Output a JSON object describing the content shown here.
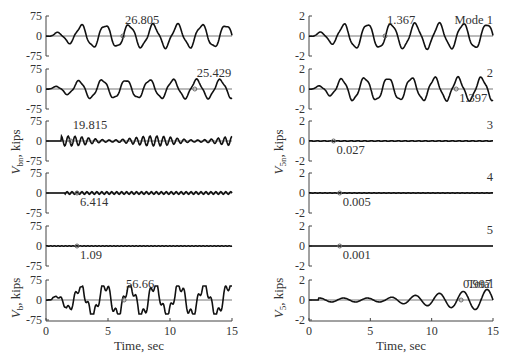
{
  "chart_data": [
    {
      "type": "line",
      "column": "left",
      "ylabel": "V_bn, kips",
      "xlabel": "Time, sec",
      "xlim": [
        0,
        15
      ],
      "xticks": [
        0,
        5,
        10,
        15
      ],
      "panels": [
        {
          "mode": 1,
          "ylim": [
            -75,
            75
          ],
          "yticks": [
            "75",
            "0",
            "-75"
          ],
          "peak_label": "26.805",
          "peak_time": 6.2
        },
        {
          "mode": 2,
          "ylim": [
            -75,
            75
          ],
          "yticks": [
            "75",
            "0",
            "-75"
          ],
          "peak_label": "25.429",
          "peak_time": 12.0
        },
        {
          "mode": 3,
          "ylim": [
            -75,
            75
          ],
          "yticks": [
            "75",
            "0",
            "-75"
          ],
          "peak_label": "19.815",
          "peak_time": 2.0
        },
        {
          "mode": 4,
          "ylim": [
            -75,
            75
          ],
          "yticks": [
            "75",
            "0",
            "-75"
          ],
          "peak_label": "6.414",
          "peak_time": 2.5
        },
        {
          "mode": 5,
          "ylim": [
            -75,
            75
          ],
          "yticks": [
            "75",
            "0",
            "-75"
          ],
          "peak_label": "1.09",
          "peak_time": 2.5
        },
        {
          "mode": "Total",
          "ylabel": "V_b, kips",
          "ylim": [
            -75,
            75
          ],
          "yticks": [
            "75",
            "0",
            "-75"
          ],
          "peak_label": "56.66",
          "peak_time": 6.3
        }
      ]
    },
    {
      "type": "line",
      "column": "right",
      "ylabel": "V_5n, kips",
      "xlabel": "Time, sec",
      "xlim": [
        0,
        15
      ],
      "xticks": [
        0,
        5,
        10,
        15
      ],
      "panels": [
        {
          "mode": 1,
          "tag": "Mode 1",
          "ylim": [
            -2,
            2
          ],
          "yticks": [
            "2",
            "0",
            "-2"
          ],
          "peak_label": "1.367",
          "peak_time": 6.2
        },
        {
          "mode": 2,
          "tag": "2",
          "ylim": [
            -2,
            2
          ],
          "yticks": [
            "2",
            "0",
            "-2"
          ],
          "peak_label": "1.397",
          "peak_time": 12.0
        },
        {
          "mode": 3,
          "tag": "3",
          "ylim": [
            -2,
            2
          ],
          "yticks": [
            "2",
            "0",
            "-2"
          ],
          "peak_label": "0.027",
          "peak_time": 2.0
        },
        {
          "mode": 4,
          "tag": "4",
          "ylim": [
            -2,
            2
          ],
          "yticks": [
            "2",
            "0",
            "-2"
          ],
          "peak_label": "0.005",
          "peak_time": 2.5
        },
        {
          "mode": 5,
          "tag": "5",
          "ylim": [
            -2,
            2
          ],
          "yticks": [
            "2",
            "0",
            "-2"
          ],
          "peak_label": "0.001",
          "peak_time": 2.5
        },
        {
          "mode": "Total",
          "tag": "Total",
          "ylabel": "V_5, kips",
          "ylim": [
            -2,
            2
          ],
          "yticks": [
            "2",
            "0",
            "-2"
          ],
          "peak_label": "0.997",
          "peak_time": 12.4
        }
      ]
    }
  ],
  "labels": {
    "left_ylabel_main": "V",
    "left_ylabel_sub": "bn",
    "left_ylabel_unit": ", kips",
    "left_total_ylabel_main": "V",
    "left_total_ylabel_sub": "b",
    "right_ylabel_main": "V",
    "right_ylabel_sub": "5n",
    "right_total_ylabel_main": "V",
    "right_total_ylabel_sub": "5",
    "xlabel": "Time, sec",
    "xticks": [
      "0",
      "5",
      "10",
      "15"
    ]
  }
}
